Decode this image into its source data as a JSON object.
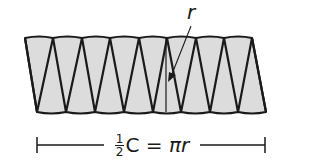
{
  "diagram": {
    "fill_color": "#dcdcdc",
    "stroke_color": "#1a1a1a",
    "top_vertices_x": [
      25,
      53,
      82,
      110,
      139,
      167,
      196,
      224,
      252
    ],
    "bottom_vertices_x": [
      37,
      66,
      95,
      124,
      153,
      181,
      210,
      238,
      266
    ],
    "top_y": 38,
    "bottom_y": 112,
    "radius_label": "r",
    "dimension": {
      "fraction_numerator": "1",
      "fraction_denominator": "2",
      "text_after_fraction": "C = ",
      "pi_r": "πr"
    }
  }
}
